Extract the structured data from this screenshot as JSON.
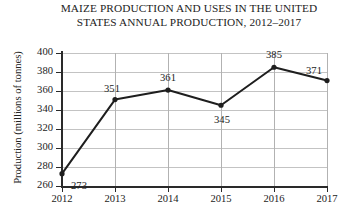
{
  "chart_data": {
    "type": "line",
    "title": "MAIZE PRODUCTION AND USES IN THE UNITED STATES ANNUAL PRODUCTION, 2012–2017",
    "title_lines": [
      "MAIZE PRODUCTION AND USES IN THE UNITED",
      "STATES ANNUAL PRODUCTION, 2012–2017"
    ],
    "xlabel": "",
    "ylabel": "Production (millions of tonnes)",
    "categories": [
      "2012",
      "2013",
      "2014",
      "2015",
      "2016",
      "2017"
    ],
    "values": [
      273,
      351,
      361,
      345,
      385,
      371
    ],
    "data_labels": [
      "273",
      "351",
      "361",
      "345",
      "385",
      "371"
    ],
    "ylim": [
      260,
      400
    ],
    "ytick_step": 20,
    "ytick_labels": [
      "400",
      "380",
      "360",
      "340",
      "320",
      "300",
      "280",
      "260"
    ],
    "xtick_labels": [
      "2012",
      "2013",
      "2014",
      "2015",
      "2016",
      "2017"
    ],
    "grid": "both",
    "legend": "none",
    "series_color": "#1e1e1e",
    "gridline_color": "#c3c3c3",
    "axis_color": "#2a2a2a",
    "marker": "circle"
  }
}
